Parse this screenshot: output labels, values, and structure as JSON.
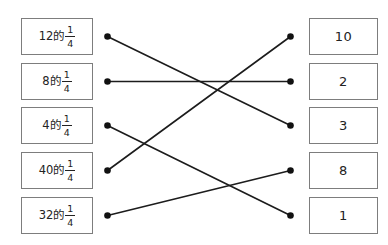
{
  "diagram": {
    "type": "matching-exercise",
    "left_items": [
      {
        "prefix": "12的",
        "fraction": {
          "numerator": "1",
          "denominator": "4"
        }
      },
      {
        "prefix": "8的",
        "fraction": {
          "numerator": "1",
          "denominator": "4"
        }
      },
      {
        "prefix": "4的",
        "fraction": {
          "numerator": "1",
          "denominator": "4"
        }
      },
      {
        "prefix": "40的",
        "fraction": {
          "numerator": "1",
          "denominator": "4"
        }
      },
      {
        "prefix": "32的",
        "fraction": {
          "numerator": "1",
          "denominator": "4"
        }
      }
    ],
    "right_items": [
      {
        "label": "10"
      },
      {
        "label": "2"
      },
      {
        "label": "3"
      },
      {
        "label": "8"
      },
      {
        "label": "1"
      }
    ],
    "connections": [
      {
        "from_left": 0,
        "to_right": 2
      },
      {
        "from_left": 1,
        "to_right": 1
      },
      {
        "from_left": 2,
        "to_right": 4
      },
      {
        "from_left": 3,
        "to_right": 0
      },
      {
        "from_left": 4,
        "to_right": 3
      }
    ],
    "colors": {
      "background": "#ffffff",
      "box_border": "#7d7d7d",
      "line": "#1c1c1c",
      "dot": "#111111",
      "text": "#222222"
    }
  }
}
